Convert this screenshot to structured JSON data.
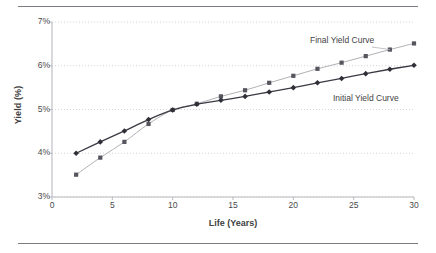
{
  "chart_data": {
    "type": "line",
    "title": "",
    "xlabel": "Life (Years)",
    "ylabel": "Yield (%)",
    "xlim": [
      0,
      30
    ],
    "ylim": [
      3,
      7
    ],
    "xticks": [
      "0",
      "5",
      "10",
      "15",
      "20",
      "25",
      "30"
    ],
    "xtick_values": [
      0,
      5,
      10,
      15,
      20,
      25,
      30
    ],
    "yticks": [
      "3%",
      "4%",
      "5%",
      "6%",
      "7%"
    ],
    "ytick_values": [
      3,
      4,
      5,
      6,
      7
    ],
    "grid": "horizontal-dotted",
    "legend": "inline-annotations",
    "x": [
      2,
      4,
      6,
      8,
      10,
      12,
      14,
      16,
      18,
      20,
      22,
      24,
      26,
      28,
      30
    ],
    "series": [
      {
        "name": "Initial Yield Curve",
        "marker": "diamond",
        "color": "#2f2f38",
        "line_color": "#3a3a44",
        "values": [
          4.0,
          4.26,
          4.51,
          4.77,
          4.99,
          5.12,
          5.21,
          5.3,
          5.4,
          5.5,
          5.61,
          5.71,
          5.82,
          5.92,
          6.01
        ]
      },
      {
        "name": "Final Yield Curve",
        "marker": "square",
        "color": "#55555e",
        "line_color": "#a8a8ae",
        "values": [
          3.51,
          3.9,
          4.26,
          4.67,
          4.99,
          5.13,
          5.3,
          5.44,
          5.61,
          5.77,
          5.93,
          6.07,
          6.22,
          6.37,
          6.51
        ]
      }
    ],
    "annotations": [
      {
        "text": "Final Yield Curve",
        "for": "Final Yield Curve"
      },
      {
        "text": "Initial Yield Curve",
        "for": "Initial Yield Curve"
      }
    ],
    "colors": {
      "background": "#ffffff",
      "axis": "#b9b9bf",
      "gridline": "#c9c9d0",
      "rule": "#7b7b82",
      "text": "#4a4a4a"
    }
  }
}
